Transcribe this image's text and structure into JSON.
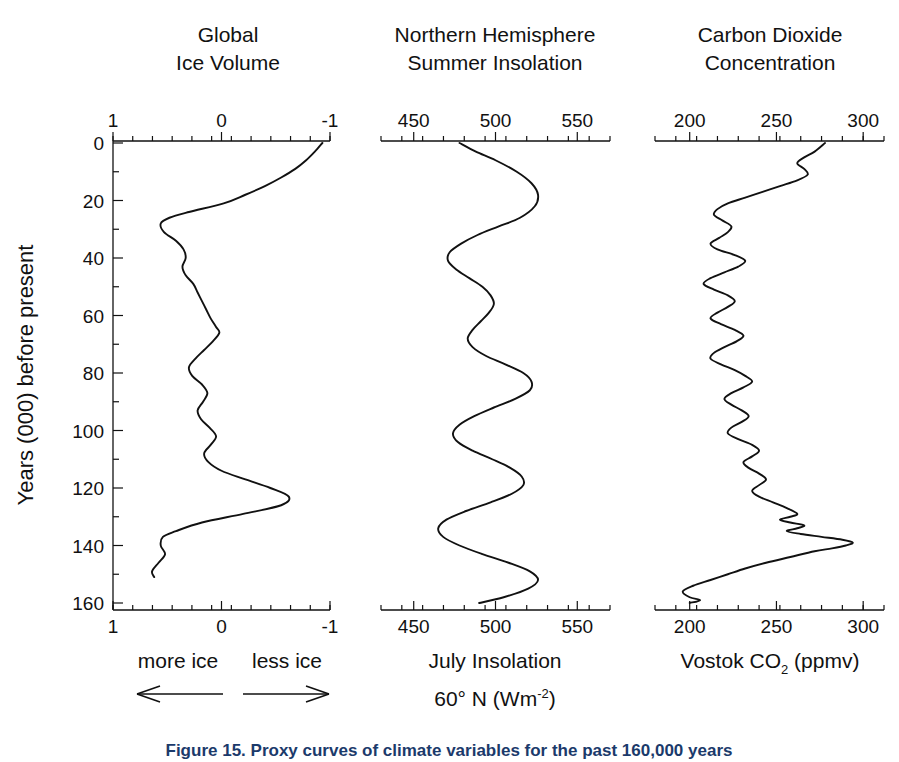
{
  "figure": {
    "caption": "Figure 15. Proxy curves of climate variables for the past 160,000 years",
    "y_axis_label": "Years (000) before present",
    "y_ticks": [
      0,
      20,
      40,
      60,
      80,
      100,
      120,
      140,
      160
    ],
    "y_range": [
      0,
      160
    ]
  },
  "panels": [
    {
      "id": "global-ice-volume",
      "title_line1": "Global",
      "title_line2": "Ice Volume",
      "x_ticks": [
        "1",
        "0",
        "-1"
      ],
      "x_tick_values": [
        1,
        0,
        -1
      ],
      "x_range": [
        1,
        -1
      ],
      "bottom_caption_left": "more ice",
      "bottom_caption_right": "less ice",
      "arrow_left": "left-arrow",
      "arrow_right": "right-arrow"
    },
    {
      "id": "northern-hemisphere-summer-insolation",
      "title_line1": "Northern Hemisphere",
      "title_line2": "Summer Insolation",
      "x_ticks": [
        "450",
        "500",
        "550"
      ],
      "x_tick_values": [
        450,
        500,
        550
      ],
      "x_range": [
        430,
        570
      ],
      "bottom_caption_line1": "July Insolation",
      "bottom_caption_line2_pre": "60° N (Wm",
      "bottom_caption_line2_sup": "-2",
      "bottom_caption_line2_post": ")"
    },
    {
      "id": "carbon-dioxide-concentration",
      "title_line1": "Carbon Dioxide",
      "title_line2": "Concentration",
      "x_ticks": [
        "200",
        "250",
        "300"
      ],
      "x_tick_values": [
        200,
        250,
        300
      ],
      "x_range": [
        180,
        312
      ],
      "bottom_caption_pre": "Vostok CO",
      "bottom_caption_sub": "2",
      "bottom_caption_post": " (ppmv)"
    }
  ],
  "chart_data": [
    {
      "type": "line",
      "title": "Global Ice Volume",
      "xlabel": "more ice ← / → less ice",
      "ylabel": "Years (000) before present",
      "xlim": [
        1,
        -1
      ],
      "ylim": [
        0,
        160
      ],
      "grid": false,
      "legend": "none",
      "x_unit": "relative ice volume index",
      "y_unit": "thousand years before present",
      "series": [
        {
          "name": "Global ice volume",
          "points": [
            [
              -0.93,
              0
            ],
            [
              -0.86,
              3
            ],
            [
              -0.78,
              6
            ],
            [
              -0.68,
              9
            ],
            [
              -0.55,
              12
            ],
            [
              -0.4,
              15
            ],
            [
              -0.22,
              18
            ],
            [
              -0.02,
              21
            ],
            [
              0.3,
              24
            ],
            [
              0.48,
              26
            ],
            [
              0.56,
              28
            ],
            [
              0.53,
              31
            ],
            [
              0.42,
              34
            ],
            [
              0.35,
              37
            ],
            [
              0.33,
              40
            ],
            [
              0.36,
              43
            ],
            [
              0.33,
              46
            ],
            [
              0.26,
              49
            ],
            [
              0.22,
              52
            ],
            [
              0.18,
              55
            ],
            [
              0.14,
              58
            ],
            [
              0.1,
              61
            ],
            [
              0.05,
              64
            ],
            [
              0.02,
              66
            ],
            [
              0.08,
              69
            ],
            [
              0.16,
              72
            ],
            [
              0.24,
              75
            ],
            [
              0.3,
              78
            ],
            [
              0.27,
              81
            ],
            [
              0.18,
              84
            ],
            [
              0.13,
              87
            ],
            [
              0.17,
              90
            ],
            [
              0.22,
              93
            ],
            [
              0.19,
              96
            ],
            [
              0.11,
              99
            ],
            [
              0.05,
              102
            ],
            [
              0.1,
              105
            ],
            [
              0.16,
              108
            ],
            [
              0.12,
              111
            ],
            [
              0.0,
              114
            ],
            [
              -0.22,
              117
            ],
            [
              -0.45,
              120
            ],
            [
              -0.62,
              123
            ],
            [
              -0.55,
              126
            ],
            [
              -0.2,
              129
            ],
            [
              0.18,
              132
            ],
            [
              0.42,
              135
            ],
            [
              0.54,
              137
            ],
            [
              0.56,
              140
            ],
            [
              0.52,
              143
            ],
            [
              0.58,
              146
            ],
            [
              0.64,
              149
            ],
            [
              0.62,
              151
            ]
          ]
        }
      ]
    },
    {
      "type": "line",
      "title": "Northern Hemisphere Summer Insolation",
      "xlabel": "July Insolation 60° N (Wm-2)",
      "ylabel": "Years (000) before present",
      "xlim": [
        430,
        570
      ],
      "ylim": [
        0,
        160
      ],
      "grid": false,
      "legend": "none",
      "x_unit": "Wm-2",
      "y_unit": "thousand years before present",
      "series": [
        {
          "name": "July insolation at 60°N",
          "points": [
            [
              478,
              0
            ],
            [
              488,
              3
            ],
            [
              500,
              6
            ],
            [
              513,
              10
            ],
            [
              522,
              14
            ],
            [
              526,
              18
            ],
            [
              524,
              22
            ],
            [
              515,
              26
            ],
            [
              502,
              29
            ],
            [
              489,
              32
            ],
            [
              479,
              35
            ],
            [
              472,
              38
            ],
            [
              471,
              41
            ],
            [
              476,
              44
            ],
            [
              484,
              47
            ],
            [
              492,
              50
            ],
            [
              497,
              53
            ],
            [
              499,
              56
            ],
            [
              496,
              59
            ],
            [
              491,
              62
            ],
            [
              486,
              65
            ],
            [
              483,
              68
            ],
            [
              486,
              71
            ],
            [
              494,
              74
            ],
            [
              506,
              77
            ],
            [
              517,
              80
            ],
            [
              522,
              83
            ],
            [
              521,
              86
            ],
            [
              512,
              89
            ],
            [
              499,
              92
            ],
            [
              487,
              95
            ],
            [
              478,
              98
            ],
            [
              474,
              101
            ],
            [
              477,
              104
            ],
            [
              486,
              107
            ],
            [
              498,
              110
            ],
            [
              509,
              113
            ],
            [
              516,
              116
            ],
            [
              517,
              119
            ],
            [
              510,
              122
            ],
            [
              497,
              125
            ],
            [
              482,
              128
            ],
            [
              470,
              131
            ],
            [
              465,
              134
            ],
            [
              468,
              137
            ],
            [
              478,
              140
            ],
            [
              492,
              143
            ],
            [
              508,
              146
            ],
            [
              521,
              149
            ],
            [
              526,
              152
            ],
            [
              520,
              155
            ],
            [
              505,
              158
            ],
            [
              490,
              160
            ]
          ]
        }
      ]
    },
    {
      "type": "line",
      "title": "Carbon Dioxide Concentration",
      "xlabel": "Vostok CO2 (ppmv)",
      "ylabel": "Years (000) before present",
      "xlim": [
        180,
        312
      ],
      "ylim": [
        0,
        160
      ],
      "grid": false,
      "legend": "none",
      "x_unit": "ppmv",
      "y_unit": "thousand years before present",
      "series": [
        {
          "name": "Vostok CO2",
          "points": [
            [
              278,
              0
            ],
            [
              272,
              3
            ],
            [
              266,
              5
            ],
            [
              262,
              7
            ],
            [
              266,
              9
            ],
            [
              268,
              11
            ],
            [
              262,
              13
            ],
            [
              252,
              15
            ],
            [
              242,
              17
            ],
            [
              232,
              19
            ],
            [
              222,
              21
            ],
            [
              216,
              23
            ],
            [
              214,
              25
            ],
            [
              219,
              27
            ],
            [
              224,
              29
            ],
            [
              222,
              31
            ],
            [
              217,
              33
            ],
            [
              212,
              35
            ],
            [
              216,
              37
            ],
            [
              226,
              39
            ],
            [
              232,
              41
            ],
            [
              228,
              43
            ],
            [
              220,
              45
            ],
            [
              212,
              47
            ],
            [
              208,
              49
            ],
            [
              214,
              51
            ],
            [
              222,
              53
            ],
            [
              226,
              55
            ],
            [
              222,
              57
            ],
            [
              216,
              59
            ],
            [
              212,
              61
            ],
            [
              218,
              63
            ],
            [
              226,
              65
            ],
            [
              231,
              67
            ],
            [
              227,
              69
            ],
            [
              220,
              71
            ],
            [
              214,
              73
            ],
            [
              212,
              75
            ],
            [
              218,
              77
            ],
            [
              226,
              79
            ],
            [
              232,
              81
            ],
            [
              236,
              83
            ],
            [
              231,
              85
            ],
            [
              224,
              87
            ],
            [
              220,
              89
            ],
            [
              224,
              91
            ],
            [
              230,
              93
            ],
            [
              234,
              95
            ],
            [
              230,
              97
            ],
            [
              224,
              99
            ],
            [
              222,
              101
            ],
            [
              228,
              103
            ],
            [
              236,
              105
            ],
            [
              240,
              107
            ],
            [
              236,
              109
            ],
            [
              231,
              111
            ],
            [
              234,
              113
            ],
            [
              240,
              115
            ],
            [
              244,
              117
            ],
            [
              240,
              119
            ],
            [
              236,
              121
            ],
            [
              240,
              123
            ],
            [
              248,
              125
            ],
            [
              256,
              127
            ],
            [
              262,
              129
            ],
            [
              258,
              130
            ],
            [
              252,
              131
            ],
            [
              258,
              132
            ],
            [
              266,
              133
            ],
            [
              262,
              134
            ],
            [
              256,
              135
            ],
            [
              264,
              136
            ],
            [
              276,
              137
            ],
            [
              288,
              138
            ],
            [
              294,
              139
            ],
            [
              290,
              140
            ],
            [
              282,
              141
            ],
            [
              272,
              142
            ],
            [
              258,
              144
            ],
            [
              244,
              146
            ],
            [
              232,
              148
            ],
            [
              222,
              150
            ],
            [
              212,
              152
            ],
            [
              202,
              154
            ],
            [
              196,
              156
            ],
            [
              200,
              158
            ],
            [
              206,
              159
            ],
            [
              200,
              160
            ]
          ]
        }
      ]
    }
  ]
}
